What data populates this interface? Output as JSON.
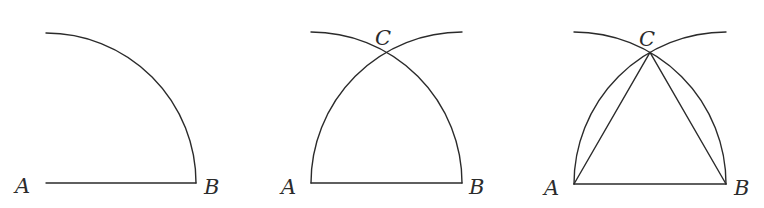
{
  "diagram": {
    "stroke_color": "#2b2b2b",
    "background": "#ffffff",
    "panels": [
      {
        "step": 1,
        "labels": {
          "a": "A",
          "b": "B"
        },
        "points": {
          "A": [
            46,
            183
          ],
          "B": [
            196,
            183
          ]
        },
        "elements": [
          "segment AB",
          "quarter arc centered at A through B"
        ]
      },
      {
        "step": 2,
        "labels": {
          "a": "A",
          "b": "B",
          "c": "C"
        },
        "points": {
          "A": [
            311,
            183
          ],
          "B": [
            462,
            183
          ],
          "C": [
            386.5,
            52
          ]
        },
        "elements": [
          "segment AB",
          "arc centered at A through B",
          "arc centered at B through A",
          "intersection C"
        ]
      },
      {
        "step": 3,
        "labels": {
          "a": "A",
          "b": "B",
          "c": "C"
        },
        "points": {
          "A": [
            574,
            184
          ],
          "B": [
            726,
            184
          ],
          "C": [
            650,
            52
          ]
        },
        "elements": [
          "segment AB",
          "arc centered at A",
          "arc centered at B",
          "segment AC",
          "segment BC"
        ]
      }
    ]
  }
}
